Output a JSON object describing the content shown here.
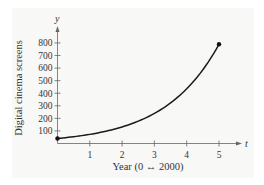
{
  "chart_data": {
    "type": "line",
    "title": "",
    "xlabel": "Year (0 ↔ 2000)",
    "ylabel": "Digital cinema screens",
    "x_var": "t",
    "y_var": "y",
    "x_ticks": [
      "1",
      "2",
      "3",
      "4",
      "5"
    ],
    "y_ticks": [
      "100",
      "200",
      "300",
      "400",
      "500",
      "600",
      "700",
      "800"
    ],
    "xlim": [
      0,
      5.7
    ],
    "ylim": [
      0,
      900
    ],
    "grid": false,
    "legend": null,
    "series": [
      {
        "name": "Digital cinema screens",
        "x": [
          0,
          1,
          2,
          3,
          4,
          5
        ],
        "values": [
          40,
          75,
          130,
          230,
          410,
          790
        ],
        "endpoints_marked": true
      }
    ]
  },
  "colors": {
    "panel_bg": "#f8f8f7",
    "curve": "#1a1a1a",
    "axis": "#555555"
  }
}
